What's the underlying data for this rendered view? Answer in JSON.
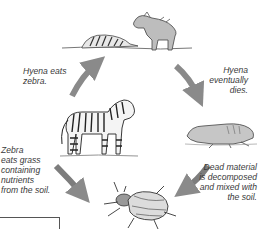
{
  "diagram": {
    "type": "cycle",
    "title": "",
    "stages": [
      {
        "id": "hyena",
        "picture": "hyena-with-zebra-carcass"
      },
      {
        "id": "dead-hyena",
        "picture": "dead-hyena"
      },
      {
        "id": "decomposer",
        "picture": "beetle"
      },
      {
        "id": "zebra",
        "picture": "zebra"
      }
    ],
    "labels": {
      "hyena_eats": "Hyena eats zebra.",
      "hyena_eats_lines": [
        "Hyena eats",
        "zebra."
      ],
      "hyena_dies_lines": [
        "Hyena",
        "eventually",
        "dies."
      ],
      "decomposed_lines": [
        "Dead material",
        "is decomposed",
        "and mixed with",
        "the soil."
      ],
      "zebra_eats_lines": [
        "Zebra",
        "eats grass",
        "containing",
        "nutrients",
        "from the soil."
      ]
    },
    "arrow_color": "#8a8a8a"
  }
}
